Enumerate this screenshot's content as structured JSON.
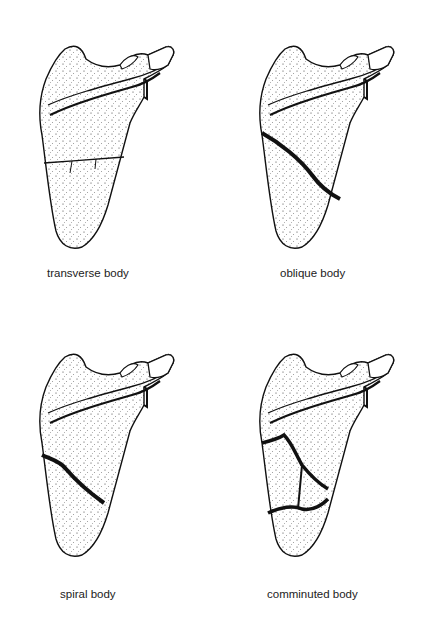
{
  "figure": {
    "panels": [
      {
        "id": "transverse",
        "label": "transverse body",
        "fracture": "transverse"
      },
      {
        "id": "oblique",
        "label": "oblique body",
        "fracture": "oblique"
      },
      {
        "id": "spiral",
        "label": "spiral body",
        "fracture": "spiral"
      },
      {
        "id": "comminuted",
        "label": "comminuted body",
        "fracture": "comminuted"
      }
    ]
  },
  "colors": {
    "ink": "#111111",
    "background": "#ffffff",
    "caption": "#222222"
  }
}
